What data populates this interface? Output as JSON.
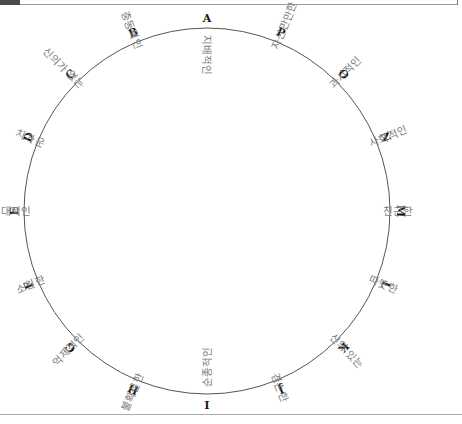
{
  "wheel": {
    "center": [
      207,
      211
    ],
    "radius": 183,
    "stroke_color": "#555555",
    "letter_color": "#1a1a1a",
    "trait_color": "#7a7a7a",
    "segments": [
      {
        "letter": "A",
        "trait": "지배적인",
        "angle": 0
      },
      {
        "letter": "B",
        "trait": "충동적인",
        "angle": -22.5
      },
      {
        "letter": "C",
        "trait": "신의가 없는",
        "angle": -45
      },
      {
        "letter": "D",
        "trait": "차가운",
        "angle": -67.5
      },
      {
        "letter": "E",
        "trait": "적대적인",
        "angle": -90
      },
      {
        "letter": "F",
        "trait": "소원한",
        "angle": -112.5
      },
      {
        "letter": "G",
        "trait": "억제적인",
        "angle": -135
      },
      {
        "letter": "H",
        "trait": "불확실한",
        "angle": -157.5
      },
      {
        "letter": "I",
        "trait": "순종적인",
        "angle": 180
      },
      {
        "letter": "J",
        "trait": "겸손한",
        "angle": 157.5
      },
      {
        "letter": "K",
        "trait": "신의 있는",
        "angle": 135
      },
      {
        "letter": "L",
        "trait": "따뜻한",
        "angle": 112.5
      },
      {
        "letter": "M",
        "trait": "친근한",
        "angle": 90
      },
      {
        "letter": "N",
        "trait": "사회적인",
        "angle": 67.5
      },
      {
        "letter": "O",
        "trait": "과시적인",
        "angle": 45
      },
      {
        "letter": "P",
        "trait": "자신만만한",
        "angle": 22.5
      }
    ]
  }
}
